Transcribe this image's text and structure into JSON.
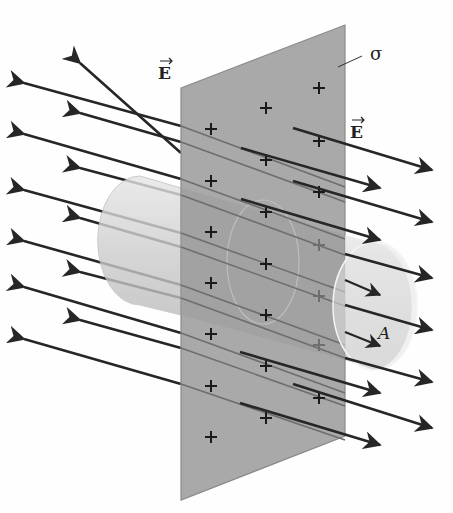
{
  "figure": {
    "labels": {
      "field_left": "E",
      "field_right": "E",
      "surface_charge": "σ",
      "area": "A"
    },
    "charge_symbol": "+",
    "colors": {
      "sheet": "#a9a9a9",
      "sheet_edge": "#8a8a8a",
      "cylinder": "#d6d6d6",
      "arrow": "#262626",
      "arrow_through": "#6e6e6e",
      "background": "#fefefe"
    }
  }
}
